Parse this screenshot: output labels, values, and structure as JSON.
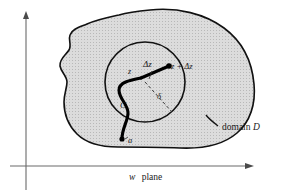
{
  "figure": {
    "type": "math-diagram",
    "caption_axis": {
      "variable": "w",
      "word": "plane",
      "full": "w plane"
    },
    "labels": {
      "point_z": "z",
      "segment_delta_z": "Δz",
      "point_z_plus_delta_z": "z + Δz",
      "radius_delta": "δ",
      "curve_c": "C",
      "point_a": "a",
      "domain_word": "domain",
      "domain_symbol": "D"
    },
    "colors": {
      "region_fill": "#d4d4d4",
      "stroke": "#111111",
      "axis": "#555555",
      "background": "#ffffff",
      "curve": "#000000"
    },
    "geometry": {
      "axes": {
        "vertical_x": 26,
        "vertical_top_y": 14,
        "vertical_bottom_y": 190,
        "horizontal_y": 166,
        "horizontal_left_x": 10,
        "horizontal_right_x": 253
      },
      "circle": {
        "center_x": 145,
        "center_y": 82,
        "radius": 40
      },
      "point_z": {
        "x": 141,
        "y": 78
      },
      "point_z_plus_delta_z": {
        "x": 169,
        "y": 66
      },
      "point_a": {
        "x": 122,
        "y": 139
      }
    }
  }
}
